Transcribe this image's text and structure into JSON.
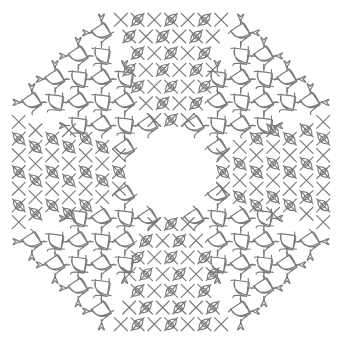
{
  "artwork": {
    "title": "Kolam Mandala",
    "kind": "line-drawing",
    "alt_text": "Symmetric kolam lattice pattern with knot loops and an empty octagonal centre"
  },
  "canvas": {
    "width": 342,
    "height": 344,
    "background_color": "#ffffff"
  },
  "style": {
    "stroke_color": "#7a7a7a",
    "stroke_color_soft": "#8e8e8e",
    "stroke_width": 1.15,
    "fill": "none",
    "line_cap": "round"
  },
  "geometry": {
    "center_x": 171,
    "center_y": 172,
    "grid_spacing": 23.2,
    "grid_half_steps": 7,
    "inner_void_radius": 46,
    "outer_radius": 163,
    "knot_size": 7.2,
    "knot_overshoot": 3.6,
    "diagonal_band_count": 4,
    "symmetry_order": 4,
    "terminal_flag_length": 11
  },
  "layers": [
    {
      "name": "orthogonal-quadrant-lattice",
      "description": "Axis-aligned grid rails forming four corner quadrants"
    },
    {
      "name": "quadrant-knots",
      "description": "Small leaf/loop knots seated at each lattice crossing"
    },
    {
      "name": "diagonal-bands",
      "description": "Interlaced diagonal lattice along the four cardinal axes"
    },
    {
      "name": "diagonal-eyes",
      "description": "Lens shaped eye loops at diagonal intersections"
    },
    {
      "name": "perimeter-terminals",
      "description": "Flag and fish tail flourishes terminating outer rails"
    }
  ],
  "chart_data": {
    "type": "scatter",
    "xlabel": "",
    "ylabel": "",
    "xlim": [
      0,
      342
    ],
    "ylim": [
      0,
      344
    ],
    "grid": false,
    "legend": "none"
  }
}
